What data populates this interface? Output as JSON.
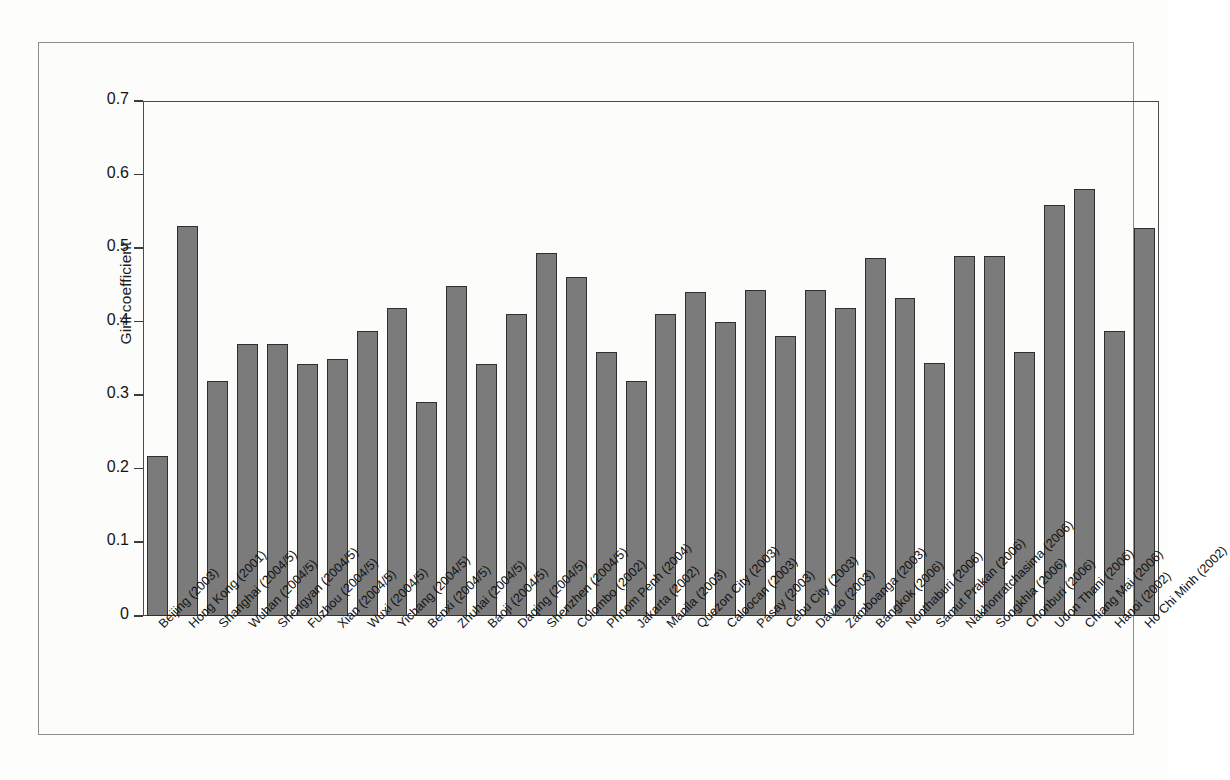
{
  "chart_data": {
    "type": "bar",
    "title": "",
    "xlabel": "",
    "ylabel": "Gini coefficient",
    "ylim": [
      0,
      0.7
    ],
    "yticks": [
      "0",
      "0.1",
      "0.2",
      "0.3",
      "0.4",
      "0.5",
      "0.6",
      "0.7"
    ],
    "ytick_values": [
      0,
      0.1,
      0.2,
      0.3,
      0.4,
      0.5,
      0.6,
      0.7
    ],
    "grid": false,
    "legend": null,
    "bar_color": "#7b7b7b",
    "bar_edge_color": "#2f2f2f",
    "categories": [
      "Beijing (2003)",
      "Hong Kong (2001)",
      "Shanghai (2004/5)",
      "Wuhan (2004/5)",
      "Shengyan (2004/5)",
      "Fuzhou (2004/5)",
      "Xian (2004/5)",
      "Wuxi (2004/5)",
      "Yichang (2004/5)",
      "Benxi (2004/5)",
      "Zhuhai (2004/5)",
      "Baoji (2004/5)",
      "Daqing (2004/5)",
      "Shenzhen (2004/5)",
      "Colombo (2002)",
      "Phnom Penh (2004)",
      "Jakarta (2002)",
      "Manila (2003)",
      "Quezon City (2003)",
      "Caloocan (2003)",
      "Pasay (2003)",
      "Cebu City (2003)",
      "Davao (2003)",
      "Zamboanga (2003)",
      "Bangkok (2006)",
      "Nonthaburi (2006)",
      "Samut Prakan (2006)",
      "Nakhonratchasima (2006)",
      "Songkhla (2006)",
      "Chonburi (2006)",
      "Udon Thani (2006)",
      "Chiang Mai (2006)",
      "Hanoi (2002)",
      "Ho Chi Minh (2002)"
    ],
    "values": [
      0.217,
      0.53,
      0.32,
      0.37,
      0.37,
      0.342,
      0.349,
      0.388,
      0.419,
      0.291,
      0.448,
      0.342,
      0.41,
      0.494,
      0.461,
      0.359,
      0.32,
      0.41,
      0.441,
      0.4,
      0.443,
      0.38,
      0.443,
      0.419,
      0.487,
      0.432,
      0.344,
      0.49,
      0.49,
      0.359,
      0.559,
      0.58,
      0.388,
      0.528
    ]
  }
}
